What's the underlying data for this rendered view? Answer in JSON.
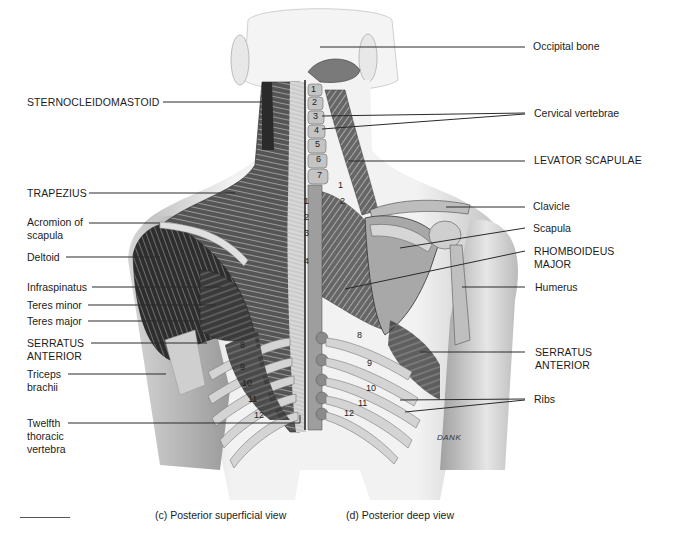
{
  "figure": {
    "left_labels": [
      {
        "id": "sternocleidomastoid",
        "text": "STERNOCLEIDOMASTOID",
        "x": 27,
        "y": 96
      },
      {
        "id": "trapezius",
        "text": "TRAPEZIUS",
        "x": 27,
        "y": 187
      },
      {
        "id": "acromion",
        "text": "Acromion of\nscapula",
        "line1": "Acromion of",
        "line2": "scapula",
        "x": 27,
        "y": 216
      },
      {
        "id": "deltoid",
        "text": "Deltoid",
        "x": 27,
        "y": 251
      },
      {
        "id": "infraspinatus",
        "text": "Infraspinatus",
        "x": 27,
        "y": 280
      },
      {
        "id": "teres_minor",
        "text": "Teres minor",
        "x": 27,
        "y": 298
      },
      {
        "id": "teres_major",
        "text": "Teres major",
        "x": 27,
        "y": 314
      },
      {
        "id": "serratus_anterior_left",
        "line1": "SERRATUS",
        "line2": "ANTERIOR",
        "x": 27,
        "y": 337
      },
      {
        "id": "triceps",
        "line1": "Triceps",
        "line2": "brachii",
        "x": 27,
        "y": 370
      },
      {
        "id": "twelfth",
        "line1": "Twelfth",
        "line2": "thoracic",
        "line3": "vertebra",
        "x": 27,
        "y": 417
      }
    ],
    "right_labels": [
      {
        "id": "occipital",
        "text": "Occipital bone",
        "x": 533,
        "y": 40
      },
      {
        "id": "cervical",
        "text": "Cervical vertebrae",
        "x": 534,
        "y": 108
      },
      {
        "id": "levator",
        "text": "LEVATOR SCAPULAE",
        "x": 534,
        "y": 154
      },
      {
        "id": "clavicle",
        "text": "Clavicle",
        "x": 533,
        "y": 200
      },
      {
        "id": "scapula",
        "text": "Scapula",
        "x": 533,
        "y": 223
      },
      {
        "id": "rhomboideus",
        "line1": "RHOMBOIDEUS",
        "line2": "MAJOR",
        "x": 534,
        "y": 245
      },
      {
        "id": "humerus",
        "text": "Humerus",
        "x": 535,
        "y": 280
      },
      {
        "id": "serratus_anterior_right",
        "line1": "SERRATUS",
        "line2": "ANTERIOR",
        "x": 535,
        "y": 346
      },
      {
        "id": "ribs",
        "text": "Ribs",
        "x": 534,
        "y": 393
      }
    ],
    "captions": {
      "left": "(c) Posterior superficial view",
      "right": "(d) Posterior deep view"
    },
    "signature": "DANK",
    "cervical_numbers": [
      "1",
      "2",
      "3",
      "4",
      "5",
      "6",
      "7"
    ],
    "thoracic_numbers_spine": [
      "1",
      "2",
      "3",
      "4"
    ],
    "thoracic_numbers_deep": [
      "1",
      "2"
    ],
    "rib_numbers_left": [
      "8",
      "9",
      "10",
      "11",
      "12"
    ],
    "rib_numbers_right": [
      "8",
      "9",
      "10",
      "11",
      "12"
    ]
  }
}
